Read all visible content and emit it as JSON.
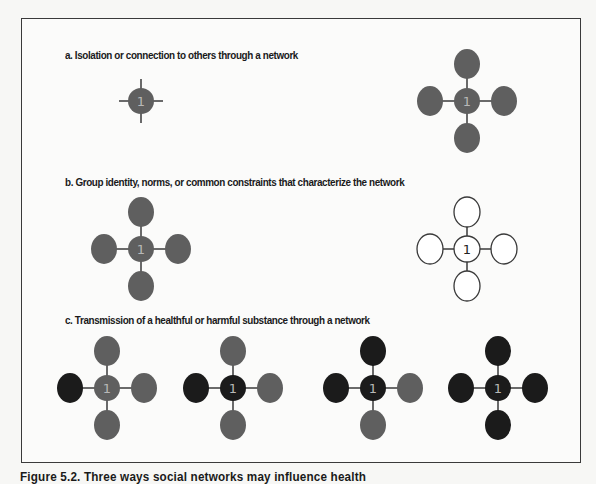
{
  "figure": {
    "caption": "Figure 5.2.  Three ways social networks may influence health",
    "colors": {
      "grey_node": "#5f5f5f",
      "black_node": "#1b1b1b",
      "edge": "#6a6a6a",
      "outline_node_fill": "#ffffff",
      "outline_node_stroke": "#3a3a3a",
      "label_on_dark": "#b8b8b8",
      "label_on_light": "#222222"
    },
    "center_label": "1",
    "sections": [
      {
        "id": "a",
        "title": "a. Isolation or connection to others through a network",
        "networks": [
          {
            "name": "isolated-node",
            "center": "grey",
            "top": null,
            "right": null,
            "bottom": null,
            "left": null,
            "stubs": true
          },
          {
            "name": "connected-network",
            "center": "grey",
            "top": "grey",
            "right": "grey",
            "bottom": "grey",
            "left": "grey"
          }
        ]
      },
      {
        "id": "b",
        "title": "b. Group identity, norms, or common constraints that characterize the network",
        "networks": [
          {
            "name": "filled-network",
            "center": "grey",
            "top": "grey",
            "right": "grey",
            "bottom": "grey",
            "left": "grey"
          },
          {
            "name": "outlined-network",
            "center": "outline",
            "top": "outline",
            "right": "outline",
            "bottom": "outline",
            "left": "outline"
          }
        ]
      },
      {
        "id": "c",
        "title": "c. Transmission of a healthful or harmful substance through a network",
        "networks": [
          {
            "name": "transmission-stage-1",
            "center": "grey",
            "top": "grey",
            "right": "grey",
            "bottom": "grey",
            "left": "black"
          },
          {
            "name": "transmission-stage-2",
            "center": "black",
            "top": "grey",
            "right": "grey",
            "bottom": "grey",
            "left": "black"
          },
          {
            "name": "transmission-stage-3",
            "center": "black",
            "top": "black",
            "right": "grey",
            "bottom": "grey",
            "left": "black"
          },
          {
            "name": "transmission-stage-4",
            "center": "black",
            "top": "black",
            "right": "black",
            "bottom": "black",
            "left": "black"
          }
        ]
      }
    ]
  }
}
